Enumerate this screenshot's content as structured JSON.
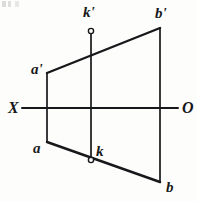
{
  "figure": {
    "background_color": "#fdfdfc",
    "ink_color": "#17181a",
    "canvas": {
      "width": 197,
      "height": 202
    }
  },
  "axis": {
    "name": "ground-line",
    "left_label": "X",
    "right_label": "O",
    "y": 108,
    "x_start": 22,
    "x_end": 178,
    "left_label_x": 8,
    "left_label_y": 100,
    "right_label_x": 182,
    "right_label_y": 100
  },
  "points": [
    {
      "id": "a-prime",
      "label": "a'",
      "x": 47,
      "y": 73,
      "label_x": 31,
      "label_y": 62,
      "marker": "none"
    },
    {
      "id": "b-prime",
      "label": "b'",
      "x": 160,
      "y": 28,
      "label_x": 155,
      "label_y": 6,
      "marker": "none"
    },
    {
      "id": "a",
      "label": "a",
      "x": 47,
      "y": 142,
      "label_x": 33,
      "label_y": 141,
      "marker": "none"
    },
    {
      "id": "b",
      "label": "b",
      "x": 160,
      "y": 182,
      "label_x": 166,
      "label_y": 180,
      "marker": "none"
    },
    {
      "id": "k-prime",
      "label": "k'",
      "x": 91,
      "y": 31,
      "label_x": 83,
      "label_y": 5,
      "marker": "open-circle"
    },
    {
      "id": "k",
      "label": "k",
      "x": 91,
      "y": 160,
      "label_x": 96,
      "label_y": 144,
      "marker": "open-circle"
    }
  ],
  "segments": [
    {
      "id": "upper-projection-ab",
      "name": "segment-a-prime-b-prime",
      "x1": 47,
      "y1": 73,
      "x2": 160,
      "y2": 28,
      "width": 2.4
    },
    {
      "id": "lower-projection-ab",
      "name": "segment-a-b",
      "x1": 47,
      "y1": 142,
      "x2": 160,
      "y2": 182,
      "width": 2.4
    },
    {
      "id": "connector-a",
      "name": "projection-line-a",
      "x1": 47,
      "y1": 73,
      "x2": 47,
      "y2": 142,
      "width": 1.7
    },
    {
      "id": "connector-b",
      "name": "projection-line-b",
      "x1": 160,
      "y1": 28,
      "x2": 160,
      "y2": 182,
      "width": 1.7
    },
    {
      "id": "connector-k",
      "name": "projection-line-k",
      "x1": 91,
      "y1": 31,
      "x2": 91,
      "y2": 160,
      "width": 1.7
    }
  ],
  "axis_line": {
    "width": 2.0
  },
  "marker_style": {
    "radius": 2.6,
    "stroke_width": 1.4,
    "fill": "#fdfdfc"
  }
}
